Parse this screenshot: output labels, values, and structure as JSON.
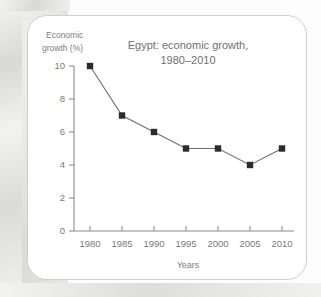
{
  "chart_data": {
    "type": "line",
    "title": "Egypt: economic growth, 1980–2010",
    "title_line1": "Egypt: economic growth,",
    "title_line2": "1980–2010",
    "xlabel": "Years",
    "ylabel": "Economic growth (%)",
    "ylabel_line1": "Economic",
    "ylabel_line2": "growth (%)",
    "categories": [
      "1980",
      "1985",
      "1990",
      "1995",
      "2000",
      "2005",
      "2010"
    ],
    "x": [
      1980,
      1985,
      1990,
      1995,
      2000,
      2005,
      2010
    ],
    "values": [
      10,
      7,
      6,
      5,
      5,
      4,
      5
    ],
    "series": [
      {
        "name": "Economic growth (%)",
        "values": [
          10,
          7,
          6,
          5,
          5,
          4,
          5
        ]
      }
    ],
    "ylim": [
      0,
      10
    ],
    "xlim": [
      1980,
      2010
    ],
    "y_ticks": [
      "0",
      "2",
      "4",
      "6",
      "8",
      "10"
    ],
    "y_tick_values": [
      0,
      2,
      4,
      6,
      8,
      10
    ],
    "x_ticks": [
      "1980",
      "1985",
      "1990",
      "1995",
      "2000",
      "2005",
      "2010"
    ],
    "grid": false,
    "legend": false,
    "legend_position": "none",
    "colors": {
      "marker": "#2b2b2b",
      "line": "#6e6e6e",
      "axis": "#8c8c8c",
      "text": "#7a7a7a",
      "card_background": "#ffffff",
      "card_border": "#cfcfcf",
      "page_background": "#e8e8e6"
    }
  }
}
